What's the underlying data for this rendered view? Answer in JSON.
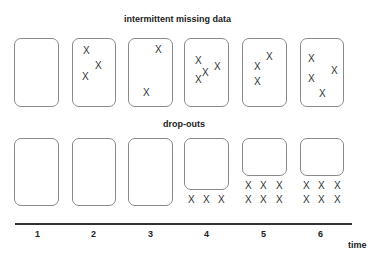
{
  "titles": {
    "top": "intermittent missing data",
    "bottom": "drop-outs"
  },
  "marker": "X",
  "axis": {
    "label": "time",
    "ticks": [
      "1",
      "2",
      "3",
      "4",
      "5",
      "6"
    ]
  },
  "intermittent": [
    {
      "time": "1",
      "missing": 0
    },
    {
      "time": "2",
      "missing": 3
    },
    {
      "time": "3",
      "missing": 2
    },
    {
      "time": "4",
      "missing": 4
    },
    {
      "time": "5",
      "missing": 3
    },
    {
      "time": "6",
      "missing": 4
    }
  ],
  "dropouts": [
    {
      "time": "1",
      "missing": 0
    },
    {
      "time": "2",
      "missing": 0
    },
    {
      "time": "3",
      "missing": 0
    },
    {
      "time": "4",
      "missing": 3
    },
    {
      "time": "5",
      "missing": 6
    },
    {
      "time": "6",
      "missing": 6
    }
  ]
}
